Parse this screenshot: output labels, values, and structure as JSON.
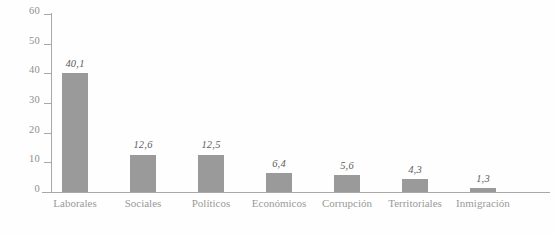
{
  "chart_data": {
    "type": "bar",
    "title": "",
    "subtitle": "",
    "xlabel": "",
    "ylabel": "",
    "categories": [
      "Laborales",
      "Sociales",
      "Políticos",
      "Económicos",
      "Corrupción",
      "Territoriales",
      "Inmigración"
    ],
    "values": [
      40.1,
      12.6,
      12.5,
      6.4,
      5.6,
      4.3,
      1.3
    ],
    "value_labels": [
      "40,1",
      "12,6",
      "12,5",
      "6,4",
      "5,6",
      "4,3",
      "1,3"
    ],
    "ylim": [
      0,
      60
    ],
    "ytick_labels": [
      "60",
      "50",
      "40",
      "30",
      "20",
      "10",
      "0"
    ],
    "ytick_values": [
      60,
      50,
      40,
      30,
      20,
      10,
      0
    ],
    "grid": false,
    "legend": false,
    "legend_position": "none",
    "bar_color": "#9a9a9a",
    "axis_color": "#a8a8a8",
    "label_color": "#9a9a9a",
    "value_label_color": "#5d5d5d",
    "background_color": "#fefefe"
  }
}
